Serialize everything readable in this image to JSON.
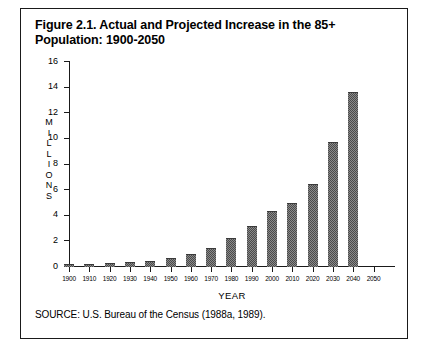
{
  "figure": {
    "title_line1": "Figure 2.1. Actual and Projected Increase in the 85+",
    "title_line2": "Population: 1900-2050",
    "source": "SOURCE: U.S. Bureau of the Census (1988a, 1989).",
    "y_axis_caption": "MILLIONS"
  },
  "chart_data": {
    "type": "bar",
    "title": "Figure 2.1. Actual and Projected Increase in the 85+ Population: 1900-2050",
    "xlabel": "YEAR",
    "ylabel": "MILLIONS",
    "categories": [
      "1900",
      "1910",
      "1920",
      "1930",
      "1940",
      "1950",
      "1960",
      "1970",
      "1980",
      "1990",
      "2000",
      "2010",
      "2020",
      "2030",
      "2040",
      "2050"
    ],
    "values": [
      0.1,
      0.1,
      0.2,
      0.3,
      0.4,
      0.6,
      0.9,
      1.4,
      2.2,
      3.1,
      4.3,
      4.9,
      6.4,
      9.7,
      13.6,
      0
    ],
    "ylim": [
      0,
      16
    ],
    "yticks": [
      0,
      2,
      4,
      6,
      8,
      10,
      12,
      14,
      16
    ],
    "grid": false,
    "legend": false
  }
}
